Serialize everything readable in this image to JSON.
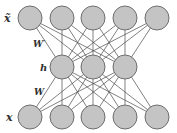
{
  "diagram": {
    "title": "",
    "type": "autoencoder",
    "layers": [
      {
        "name": "output",
        "label": "x̃",
        "nodes": 5,
        "y": 18,
        "xs": [
          30,
          62,
          93,
          125,
          157
        ]
      },
      {
        "name": "hidden",
        "label": "h",
        "nodes": 3,
        "y": 67,
        "xs": [
          62,
          93,
          125
        ]
      },
      {
        "name": "input",
        "label": "x",
        "nodes": 5,
        "y": 117,
        "xs": [
          30,
          62,
          93,
          125,
          157
        ]
      }
    ],
    "weights": [
      {
        "label": "W′",
        "between": [
          "hidden",
          "output"
        ]
      },
      {
        "label": "W",
        "between": [
          "input",
          "hidden"
        ]
      }
    ],
    "labels": {
      "x_tilde": "x̃",
      "w_prime": "W′",
      "h": "h",
      "w": "W",
      "x": "x"
    },
    "colors": {
      "node_fill": "#c4c4c4",
      "node_stroke": "#6e6e6e",
      "edge": "#4a4a4a"
    }
  }
}
